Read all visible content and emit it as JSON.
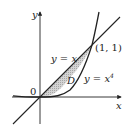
{
  "diagram": {
    "type": "region-between-curves",
    "axes": {
      "x_label": "x",
      "y_label": "y",
      "origin_label": "0"
    },
    "curves": [
      {
        "name": "line",
        "label": "y = x"
      },
      {
        "name": "quartic",
        "label_base": "y = x",
        "label_exp": "4"
      }
    ],
    "region_label": "D",
    "intersection_label": "(1, 1)",
    "colors": {
      "fill": "#c8c8c8",
      "stroke": "#222222",
      "background": "#ffffff"
    }
  }
}
